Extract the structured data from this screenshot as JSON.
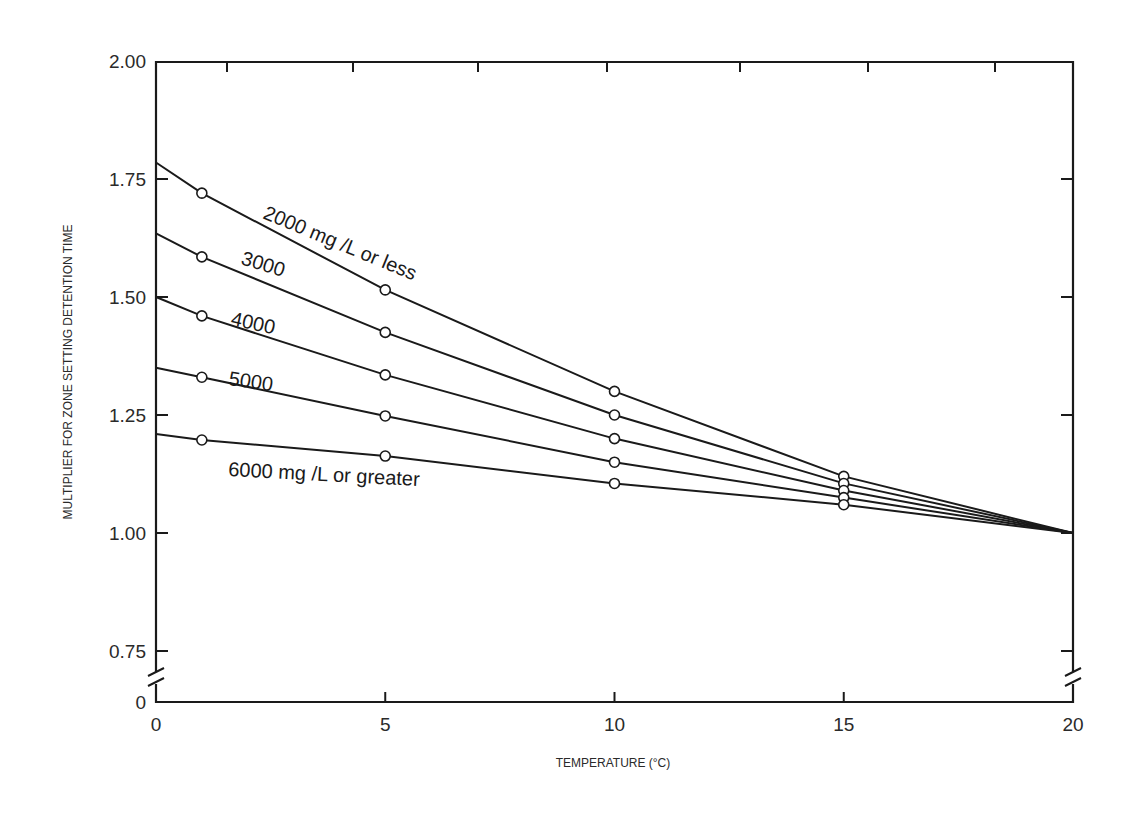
{
  "chart_data": {
    "type": "line",
    "title": "",
    "xlabel": "TEMPERATURE (°C)",
    "ylabel": "MULTIPLIER FOR ZONE SETTING DETENTION TIME",
    "xlim": [
      0,
      20
    ],
    "ylim": [
      0.75,
      2.0
    ],
    "axis_break": {
      "y": true,
      "x_side_marks": true,
      "y_break_label": "0"
    },
    "grid": false,
    "legend": "inline labels on lines",
    "x_ticks": [
      0,
      5,
      10,
      15,
      20
    ],
    "x_tick_labels": [
      "0",
      "5",
      "10",
      "15",
      "20"
    ],
    "y_ticks": [
      0.75,
      1.0,
      1.25,
      1.5,
      1.75,
      2.0
    ],
    "y_tick_labels": [
      "0.75",
      "1.00",
      "1.25",
      "1.50",
      "1.75",
      "2.00"
    ],
    "series": [
      {
        "name": "2000 mg /L or less",
        "label": "2000 mg /L or less",
        "x": [
          0,
          1,
          5,
          10,
          15,
          20
        ],
        "values": [
          1.785,
          1.72,
          1.515,
          1.3,
          1.12,
          1.0
        ],
        "markers_at": [
          1,
          5,
          10,
          15
        ]
      },
      {
        "name": "3000",
        "label": "3000",
        "x": [
          0,
          1,
          5,
          10,
          15,
          20
        ],
        "values": [
          1.635,
          1.585,
          1.425,
          1.25,
          1.105,
          1.0
        ],
        "markers_at": [
          1,
          5,
          10,
          15
        ]
      },
      {
        "name": "4000",
        "label": "4000",
        "x": [
          0,
          1,
          5,
          10,
          15,
          20
        ],
        "values": [
          1.5,
          1.46,
          1.335,
          1.2,
          1.09,
          1.0
        ],
        "markers_at": [
          1,
          5,
          10,
          15
        ]
      },
      {
        "name": "5000",
        "label": "5000",
        "x": [
          0,
          1,
          5,
          10,
          15,
          20
        ],
        "values": [
          1.35,
          1.33,
          1.248,
          1.15,
          1.075,
          1.0
        ],
        "markers_at": [
          1,
          5,
          10,
          15
        ]
      },
      {
        "name": "6000 mg /L or greater",
        "label": "6000 mg /L or greater",
        "x": [
          0,
          1,
          5,
          10,
          15,
          20
        ],
        "values": [
          1.21,
          1.197,
          1.163,
          1.105,
          1.06,
          1.0
        ],
        "markers_at": [
          1,
          5,
          10,
          15
        ]
      }
    ]
  },
  "axes": {
    "xlabel": "TEMPERATURE (°C)",
    "ylabel": "MULTIPLIER FOR ZONE SETTING DETENTION TIME",
    "y_zero_label": "0"
  },
  "colors": {
    "ink": "#1a1a1a",
    "background": "#ffffff"
  }
}
